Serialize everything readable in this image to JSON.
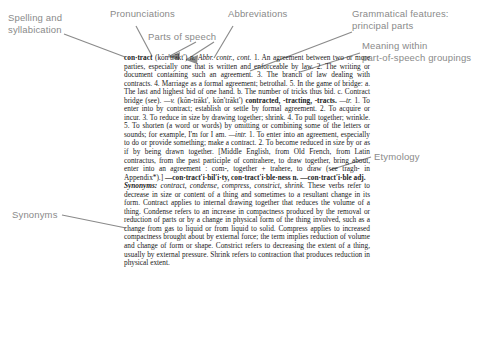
{
  "page": {
    "kind": "annotated-dictionary-entry",
    "headword": "contract",
    "ink_color": "#8a8a8a",
    "text_color": "#1a1a1a",
    "background": "#ffffff"
  },
  "callouts": [
    {
      "id": "spelling",
      "label": "Spelling and\nsyllabication"
    },
    {
      "id": "pronunciations",
      "label": "Pronunciations"
    },
    {
      "id": "abbreviations",
      "label": "Abbreviations"
    },
    {
      "id": "parts-of-speech",
      "label": "Parts of speech"
    },
    {
      "id": "grammatical",
      "label": "Grammatical features:\nprincipal parts"
    },
    {
      "id": "meaning",
      "label": "Meaning within\npart-of-speech groupings"
    },
    {
      "id": "etymology",
      "label": "Etymology"
    },
    {
      "id": "synonyms",
      "label": "Synonyms"
    }
  ],
  "entry": {
    "headword": "con·tract",
    "pronunciation": "(kŏn′trăkt′)",
    "pos_noun": "n.",
    "abbreviations": "Abbr. contr., cont.",
    "noun_senses": [
      "1. An agreement between two or more parties, especially one that is written and enforceable by law.",
      "2. The writing or document containing such an agreement.",
      "3. The branch of law dealing with contracts.",
      "4. Marriage as a formal agreement; betrothal.",
      "5. In the game of bridge: a. The last and highest bid of one hand. b. The number of tricks thus bid. c. Contract bridge (see)."
    ],
    "verb_pronunciation": "(kŏn-trăkt′, kŏn′trăkt′)",
    "principal_parts": "contracted, -tracting, -tracts.",
    "verb_tr_label": "—tr.",
    "verb_tr_senses": [
      "1. To enter into by contract; establish or settle by formal agreement.",
      "2. To acquire or incur.",
      "3. To reduce in size by drawing together; shrink.",
      "4. To pull together; wrinkle.",
      "5. To shorten (a word or words) by omitting or combining some of the letters or sounds; for example, I'm for I am."
    ],
    "verb_intr_label": "—intr.",
    "verb_intr_senses": [
      "1. To enter into an agreement, especially to do or provide something; make a contract.",
      "2. To become reduced in size by or as if by being drawn together."
    ],
    "etymology": "[Middle English, from Old French, from Latin contractus, from the past participle of contrahere, to draw together, bring about, enter into an agreement : com-, together + trahere, to draw (see tragh- in Appendix*).]",
    "derived_forms": "—con·tract′i·bil′i·ty, con·tract′i·ble·ness n. —con·tract′i·ble adj.",
    "synonyms_heading": "Synonyms:",
    "synonyms_list": "contract, condense, compress, constrict, shrink.",
    "synonyms_text": "These verbs refer to decrease in size or content of a thing and sometimes to a resultant change in its form. Contract applies to internal drawing together that reduces the volume of a thing. Condense refers to an increase in compactness produced by the removal or reduction of parts or by a change in physical form of the thing involved, such as a change from gas to liquid or from liquid to solid. Compress applies to increased compactness brought about by external force; the term implies reduction of volume and change of form or shape. Constrict refers to decreasing the extent of a thing, usually by external pressure. Shrink refers to contraction that produces reduction in physical extent."
  }
}
